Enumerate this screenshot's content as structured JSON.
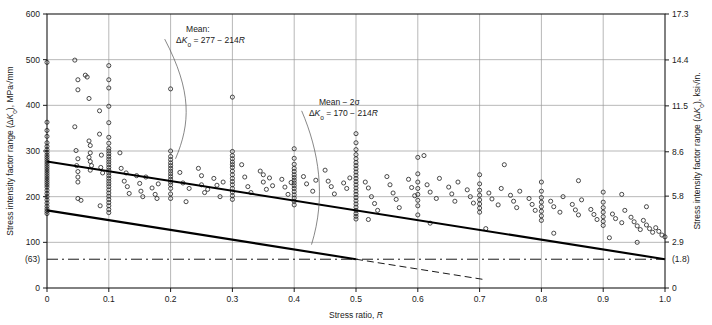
{
  "chart_data": {
    "type": "scatter",
    "title": "",
    "xlabel": "Stress ratio, R",
    "ylabel_left": "Stress intensity factor range (ΔK₀), MPa√mm",
    "ylabel_right": "Stress intensity factor range (ΔK₀), ksi√in.",
    "xlim": [
      0,
      1.0
    ],
    "ylim_left": [
      0,
      600
    ],
    "ylim_right": [
      0,
      17.3
    ],
    "grid": true,
    "legend": "none",
    "xticks": [
      "0",
      "0.1",
      "0.2",
      "0.3",
      "0.4",
      "0.5",
      "0.6",
      "0.7",
      "0.8",
      "0.9",
      "1.0"
    ],
    "xtick_values": [
      0,
      0.1,
      0.2,
      0.3,
      0.4,
      0.5,
      0.6,
      0.7,
      0.8,
      0.9,
      1.0
    ],
    "yticks_left": [
      "600",
      "500",
      "400",
      "300",
      "200",
      "100",
      "(63)",
      "0"
    ],
    "ytick_values_left": [
      600,
      500,
      400,
      300,
      200,
      100,
      63,
      0
    ],
    "yticks_right": [
      "17.3",
      "14.4",
      "11.5",
      "8.6",
      "5.8",
      "2.9",
      "(1.8)",
      "0"
    ],
    "ytick_values_right": [
      17.3,
      14.4,
      11.5,
      8.6,
      5.8,
      2.9,
      1.8,
      0
    ],
    "gridlines_y": [
      500,
      400,
      300,
      200,
      100
    ],
    "threshold_line": {
      "value": 63,
      "style": "dash-dot",
      "label": "(63)"
    },
    "series": [
      {
        "name": "mean",
        "type": "line",
        "label": "Mean",
        "equation": "ΔK₀ = 277 − 214R",
        "intercept": 277,
        "slope": -214,
        "x": [
          0,
          1.0
        ],
        "y": [
          277,
          63
        ],
        "style": "solid-thick"
      },
      {
        "name": "mean-minus-2sigma",
        "type": "line",
        "label": "Mean − 2σ",
        "equation": "ΔK₀ = 170 − 214R",
        "intercept": 170,
        "slope": -214,
        "x": [
          0,
          0.5
        ],
        "y": [
          170,
          63
        ],
        "style": "solid-thick",
        "extension": {
          "x": [
            0.5,
            0.705
          ],
          "y": [
            63,
            19
          ],
          "style": "dashed"
        }
      }
    ],
    "annotations": [
      {
        "name": "mean-annotation",
        "line1": "Mean:",
        "line2": "ΔK₀ = 277 − 214R",
        "x": 0.225,
        "y": 560
      },
      {
        "name": "mean-2sigma-annotation",
        "line1": "Mean − 2σ",
        "line2": "ΔK₀ = 170 − 214R",
        "x": 0.44,
        "y": 400
      }
    ],
    "points_note": "Scatter of ΔK₀ fatigue threshold measurements vs stress ratio R",
    "points": [
      [
        0,
        494
      ],
      [
        0,
        363
      ],
      [
        0,
        345
      ],
      [
        0,
        332
      ],
      [
        0,
        318
      ],
      [
        0,
        310
      ],
      [
        0,
        303
      ],
      [
        0,
        297
      ],
      [
        0,
        291
      ],
      [
        0,
        286
      ],
      [
        0,
        281
      ],
      [
        0,
        276
      ],
      [
        0,
        271
      ],
      [
        0,
        266
      ],
      [
        0,
        261
      ],
      [
        0,
        256
      ],
      [
        0,
        251
      ],
      [
        0,
        246
      ],
      [
        0,
        241
      ],
      [
        0,
        236
      ],
      [
        0,
        231
      ],
      [
        0,
        226
      ],
      [
        0,
        221
      ],
      [
        0,
        214
      ],
      [
        0,
        207
      ],
      [
        0,
        200
      ],
      [
        0,
        193
      ],
      [
        0,
        186
      ],
      [
        0,
        179
      ],
      [
        0,
        173
      ],
      [
        0,
        168
      ],
      [
        0,
        163
      ],
      [
        0.045,
        499
      ],
      [
        0.05,
        456
      ],
      [
        0.05,
        434
      ],
      [
        0.045,
        353
      ],
      [
        0.047,
        301
      ],
      [
        0.05,
        283
      ],
      [
        0.048,
        268
      ],
      [
        0.05,
        255
      ],
      [
        0.05,
        243
      ],
      [
        0.05,
        232
      ],
      [
        0.05,
        196
      ],
      [
        0.055,
        192
      ],
      [
        0.062,
        466
      ],
      [
        0.065,
        462
      ],
      [
        0.068,
        415
      ],
      [
        0.068,
        322
      ],
      [
        0.07,
        312
      ],
      [
        0.07,
        296
      ],
      [
        0.068,
        286
      ],
      [
        0.07,
        277
      ],
      [
        0.072,
        268
      ],
      [
        0.07,
        258
      ],
      [
        0.085,
        388
      ],
      [
        0.085,
        337
      ],
      [
        0.088,
        291
      ],
      [
        0.087,
        264
      ],
      [
        0.09,
        252
      ],
      [
        0.086,
        180
      ],
      [
        0.1,
        487
      ],
      [
        0.1,
        456
      ],
      [
        0.1,
        438
      ],
      [
        0.1,
        398
      ],
      [
        0.1,
        362
      ],
      [
        0.1,
        330
      ],
      [
        0.1,
        317
      ],
      [
        0.1,
        306
      ],
      [
        0.1,
        300
      ],
      [
        0.1,
        294
      ],
      [
        0.1,
        288
      ],
      [
        0.1,
        282
      ],
      [
        0.1,
        276
      ],
      [
        0.1,
        270
      ],
      [
        0.1,
        264
      ],
      [
        0.1,
        258
      ],
      [
        0.1,
        252
      ],
      [
        0.1,
        246
      ],
      [
        0.1,
        240
      ],
      [
        0.1,
        234
      ],
      [
        0.1,
        228
      ],
      [
        0.1,
        222
      ],
      [
        0.1,
        215
      ],
      [
        0.1,
        208
      ],
      [
        0.1,
        201
      ],
      [
        0.1,
        194
      ],
      [
        0.1,
        187
      ],
      [
        0.1,
        180
      ],
      [
        0.1,
        172
      ],
      [
        0.1,
        165
      ],
      [
        0.118,
        296
      ],
      [
        0.12,
        262
      ],
      [
        0.125,
        234
      ],
      [
        0.13,
        222
      ],
      [
        0.133,
        207
      ],
      [
        0.128,
        252
      ],
      [
        0.145,
        246
      ],
      [
        0.15,
        229
      ],
      [
        0.152,
        212
      ],
      [
        0.155,
        200
      ],
      [
        0.16,
        243
      ],
      [
        0.17,
        219
      ],
      [
        0.175,
        205
      ],
      [
        0.178,
        196
      ],
      [
        0.18,
        228
      ],
      [
        0.2,
        436
      ],
      [
        0.2,
        300
      ],
      [
        0.2,
        288
      ],
      [
        0.2,
        281
      ],
      [
        0.2,
        274
      ],
      [
        0.2,
        268
      ],
      [
        0.2,
        262
      ],
      [
        0.2,
        256
      ],
      [
        0.2,
        250
      ],
      [
        0.2,
        244
      ],
      [
        0.2,
        238
      ],
      [
        0.2,
        232
      ],
      [
        0.2,
        226
      ],
      [
        0.2,
        218
      ],
      [
        0.2,
        206
      ],
      [
        0.2,
        196
      ],
      [
        0.215,
        253
      ],
      [
        0.22,
        230
      ],
      [
        0.225,
        189
      ],
      [
        0.23,
        218
      ],
      [
        0.245,
        262
      ],
      [
        0.25,
        246
      ],
      [
        0.25,
        226
      ],
      [
        0.255,
        209
      ],
      [
        0.26,
        216
      ],
      [
        0.27,
        240
      ],
      [
        0.275,
        225
      ],
      [
        0.28,
        200
      ],
      [
        0.285,
        232
      ],
      [
        0.3,
        418
      ],
      [
        0.3,
        299
      ],
      [
        0.3,
        290
      ],
      [
        0.3,
        283
      ],
      [
        0.3,
        276
      ],
      [
        0.3,
        270
      ],
      [
        0.3,
        264
      ],
      [
        0.3,
        256
      ],
      [
        0.3,
        248
      ],
      [
        0.3,
        240
      ],
      [
        0.3,
        233
      ],
      [
        0.3,
        226
      ],
      [
        0.3,
        218
      ],
      [
        0.3,
        210
      ],
      [
        0.3,
        202
      ],
      [
        0.3,
        194
      ],
      [
        0.315,
        270
      ],
      [
        0.32,
        243
      ],
      [
        0.325,
        222
      ],
      [
        0.33,
        209
      ],
      [
        0.345,
        256
      ],
      [
        0.35,
        248
      ],
      [
        0.35,
        232
      ],
      [
        0.355,
        216
      ],
      [
        0.36,
        241
      ],
      [
        0.365,
        224
      ],
      [
        0.38,
        238
      ],
      [
        0.385,
        221
      ],
      [
        0.39,
        205
      ],
      [
        0.395,
        231
      ],
      [
        0.4,
        305
      ],
      [
        0.4,
        284
      ],
      [
        0.4,
        271
      ],
      [
        0.4,
        262
      ],
      [
        0.4,
        255
      ],
      [
        0.4,
        248
      ],
      [
        0.4,
        242
      ],
      [
        0.4,
        236
      ],
      [
        0.4,
        230
      ],
      [
        0.4,
        224
      ],
      [
        0.4,
        218
      ],
      [
        0.4,
        211
      ],
      [
        0.4,
        204
      ],
      [
        0.4,
        197
      ],
      [
        0.4,
        190
      ],
      [
        0.4,
        182
      ],
      [
        0.415,
        244
      ],
      [
        0.42,
        228
      ],
      [
        0.43,
        212
      ],
      [
        0.435,
        236
      ],
      [
        0.45,
        258
      ],
      [
        0.455,
        234
      ],
      [
        0.46,
        222
      ],
      [
        0.465,
        206
      ],
      [
        0.48,
        230
      ],
      [
        0.485,
        218
      ],
      [
        0.49,
        241
      ],
      [
        0.5,
        338
      ],
      [
        0.5,
        318
      ],
      [
        0.5,
        303
      ],
      [
        0.5,
        292
      ],
      [
        0.5,
        283
      ],
      [
        0.5,
        275
      ],
      [
        0.5,
        268
      ],
      [
        0.5,
        261
      ],
      [
        0.5,
        254
      ],
      [
        0.5,
        247
      ],
      [
        0.5,
        240
      ],
      [
        0.5,
        233
      ],
      [
        0.5,
        226
      ],
      [
        0.5,
        219
      ],
      [
        0.5,
        212
      ],
      [
        0.5,
        205
      ],
      [
        0.5,
        198
      ],
      [
        0.5,
        191
      ],
      [
        0.5,
        184
      ],
      [
        0.5,
        177
      ],
      [
        0.5,
        170
      ],
      [
        0.5,
        163
      ],
      [
        0.5,
        157
      ],
      [
        0.5,
        151
      ],
      [
        0.515,
        232
      ],
      [
        0.52,
        219
      ],
      [
        0.525,
        200
      ],
      [
        0.53,
        185
      ],
      [
        0.535,
        170
      ],
      [
        0.55,
        244
      ],
      [
        0.555,
        226
      ],
      [
        0.56,
        208
      ],
      [
        0.565,
        194
      ],
      [
        0.57,
        176
      ],
      [
        0.585,
        238
      ],
      [
        0.59,
        220
      ],
      [
        0.595,
        202
      ],
      [
        0.6,
        286
      ],
      [
        0.6,
        250
      ],
      [
        0.6,
        232
      ],
      [
        0.6,
        218
      ],
      [
        0.6,
        205
      ],
      [
        0.6,
        192
      ],
      [
        0.6,
        180
      ],
      [
        0.6,
        160
      ],
      [
        0.615,
        226
      ],
      [
        0.62,
        210
      ],
      [
        0.63,
        196
      ],
      [
        0.635,
        240
      ],
      [
        0.65,
        221
      ],
      [
        0.655,
        206
      ],
      [
        0.66,
        190
      ],
      [
        0.665,
        232
      ],
      [
        0.68,
        215
      ],
      [
        0.685,
        200
      ],
      [
        0.69,
        186
      ],
      [
        0.7,
        248
      ],
      [
        0.7,
        228
      ],
      [
        0.7,
        214
      ],
      [
        0.7,
        203
      ],
      [
        0.7,
        193
      ],
      [
        0.7,
        184
      ],
      [
        0.7,
        175
      ],
      [
        0.7,
        166
      ],
      [
        0.715,
        208
      ],
      [
        0.72,
        195
      ],
      [
        0.73,
        182
      ],
      [
        0.735,
        218
      ],
      [
        0.75,
        203
      ],
      [
        0.755,
        190
      ],
      [
        0.76,
        176
      ],
      [
        0.765,
        212
      ],
      [
        0.78,
        196
      ],
      [
        0.785,
        183
      ],
      [
        0.79,
        170
      ],
      [
        0.8,
        232
      ],
      [
        0.8,
        212
      ],
      [
        0.8,
        198
      ],
      [
        0.8,
        188
      ],
      [
        0.8,
        178
      ],
      [
        0.8,
        168
      ],
      [
        0.8,
        158
      ],
      [
        0.8,
        148
      ],
      [
        0.815,
        190
      ],
      [
        0.82,
        178
      ],
      [
        0.83,
        166
      ],
      [
        0.835,
        200
      ],
      [
        0.85,
        183
      ],
      [
        0.855,
        171
      ],
      [
        0.86,
        160
      ],
      [
        0.865,
        193
      ],
      [
        0.88,
        172
      ],
      [
        0.885,
        161
      ],
      [
        0.89,
        150
      ],
      [
        0.9,
        210
      ],
      [
        0.9,
        188
      ],
      [
        0.9,
        176
      ],
      [
        0.9,
        166
      ],
      [
        0.9,
        156
      ],
      [
        0.9,
        146
      ],
      [
        0.9,
        137
      ],
      [
        0.915,
        162
      ],
      [
        0.92,
        152
      ],
      [
        0.93,
        143
      ],
      [
        0.935,
        170
      ],
      [
        0.945,
        155
      ],
      [
        0.95,
        145
      ],
      [
        0.955,
        136
      ],
      [
        0.96,
        128
      ],
      [
        0.965,
        148
      ],
      [
        0.97,
        138
      ],
      [
        0.975,
        130
      ],
      [
        0.98,
        122
      ],
      [
        0.985,
        132
      ],
      [
        0.99,
        124
      ],
      [
        0.995,
        116
      ],
      [
        1.0,
        112
      ],
      [
        0.61,
        290
      ],
      [
        0.74,
        270
      ],
      [
        0.86,
        235
      ],
      [
        0.93,
        205
      ],
      [
        0.97,
        178
      ],
      [
        0.52,
        150
      ],
      [
        0.62,
        142
      ],
      [
        0.71,
        130
      ],
      [
        0.82,
        120
      ],
      [
        0.91,
        110
      ],
      [
        0.955,
        100
      ]
    ]
  }
}
